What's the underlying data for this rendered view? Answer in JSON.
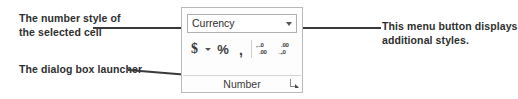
{
  "annotations": [
    {
      "id": "number-style",
      "line1": "The number style of",
      "line2": "the selected cell"
    },
    {
      "id": "dialog-launcher",
      "line1": "The dialog box launcher",
      "line2": ""
    },
    {
      "id": "menu-button",
      "line1": "This menu button displays",
      "line2": "additional styles."
    }
  ],
  "ribbon_group": {
    "group_label": "Number",
    "number_format_combo": {
      "value": "Currency",
      "dropdown_icon": "chevron-down-icon"
    },
    "buttons": [
      {
        "name": "accounting-format",
        "glyph": "$",
        "icon": "dollar-icon"
      },
      {
        "name": "accounting-dropdown",
        "glyph": "",
        "icon": "chevron-down-icon"
      },
      {
        "name": "percent-style",
        "glyph": "%",
        "icon": "percent-icon"
      },
      {
        "name": "comma-style",
        "glyph": ",",
        "icon": "comma-icon"
      },
      {
        "name": "increase-decimal",
        "glyph": "",
        "icon": "increase-decimal-icon"
      },
      {
        "name": "decrease-decimal",
        "glyph": "",
        "icon": "decrease-decimal-icon"
      }
    ],
    "decimal_icons": {
      "increase_top": ".0",
      "increase_bottom": ".00",
      "increase_arrow": "←",
      "decrease_top": ".00",
      "decrease_bottom": ".0",
      "decrease_arrow": "→"
    },
    "dialog_launcher_icon": "dialog-box-launcher-icon"
  },
  "colors": {
    "text": "#2e2e2e",
    "panel_border": "#b9b9b9",
    "leader_line": "#3a3a3a",
    "background": "#ffffff"
  }
}
